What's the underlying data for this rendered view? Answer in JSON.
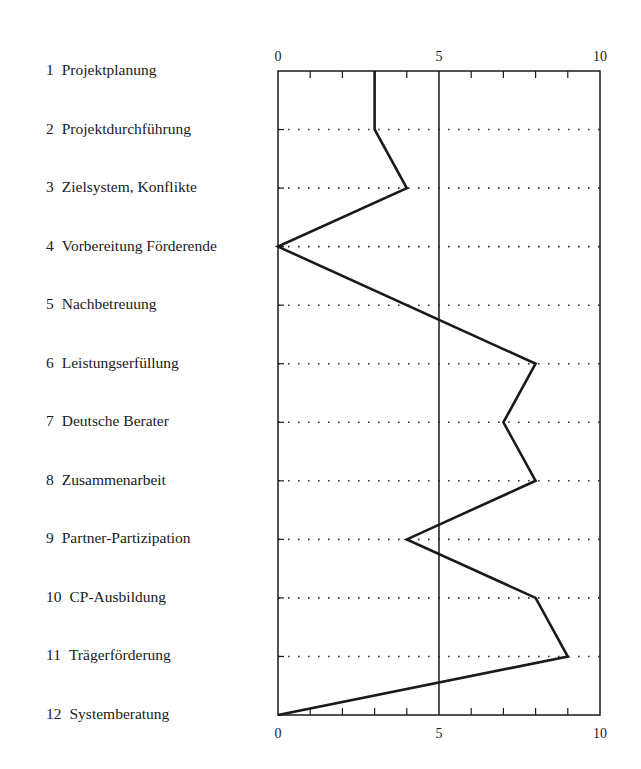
{
  "chart_data": {
    "type": "line",
    "orientation": "horizontal-profile",
    "title": "",
    "xlabel": "",
    "ylabel": "",
    "xlim": [
      0,
      10
    ],
    "x_ticks_major": [
      0,
      5,
      10
    ],
    "x_ticks_minor": [
      1,
      2,
      3,
      4,
      6,
      7,
      8,
      9
    ],
    "reference_line_x": 5,
    "grid": "dotted horizontal lines at each category",
    "legend": null,
    "categories": [
      {
        "num": "1",
        "label": "Projektplanung"
      },
      {
        "num": "2",
        "label": "Projektdurchführung"
      },
      {
        "num": "3",
        "label": "Zielsystem, Konflikte"
      },
      {
        "num": "4",
        "label": "Vorbereitung Förderende"
      },
      {
        "num": "5",
        "label": "Nachbetreuung"
      },
      {
        "num": "6",
        "label": "Leistungserfüllung"
      },
      {
        "num": "7",
        "label": "Deutsche Berater"
      },
      {
        "num": "8",
        "label": "Zusammenarbeit"
      },
      {
        "num": "9",
        "label": "Partner-Partizipation"
      },
      {
        "num": "10",
        "label": "CP-Ausbildung"
      },
      {
        "num": "11",
        "label": "Trägerförderung"
      },
      {
        "num": "12",
        "label": "Systemberatung"
      }
    ],
    "values": [
      3,
      3,
      4,
      0,
      null,
      8,
      7,
      8,
      4,
      8,
      9,
      0
    ]
  },
  "style": {
    "line_color": "#1a1a1a",
    "frame_color": "#1a1a1a",
    "grid_color": "#333333",
    "background": "#ffffff"
  }
}
